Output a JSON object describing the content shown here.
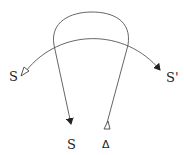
{
  "diagram": {
    "labels": {
      "left": "S",
      "right": "S'",
      "bottom_left": "S",
      "bottom_right": "Δ"
    },
    "edges": [
      {
        "from": "S",
        "to": "S'",
        "shape": "arc",
        "tail": "open-triangle",
        "head": "filled-arrow"
      },
      {
        "from": "Δ",
        "to": "S",
        "shape": "loop",
        "tail": "open-triangle",
        "head": "filled-arrow"
      }
    ],
    "colors": {
      "stroke": "#444444",
      "text": "#222222"
    }
  }
}
